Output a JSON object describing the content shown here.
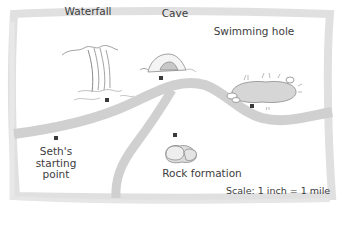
{
  "map": {
    "colors": {
      "background": "#ffffff",
      "border": "#dcdcdc",
      "road": "#cfcfcf",
      "marker": "#3a3a3a",
      "text": "#3d3d3d",
      "icon_stroke": "#8a8a8a",
      "water_fill": "#d6d6d6"
    },
    "landmarks": [
      {
        "id": "waterfall",
        "label": "Waterfall",
        "icon": "waterfall-icon",
        "label_x": 88,
        "label_y": 6,
        "marker_x": 107,
        "marker_y": 100
      },
      {
        "id": "cave",
        "label": "Cave",
        "icon": "cave-icon",
        "label_x": 175,
        "label_y": 8,
        "marker_x": 161,
        "marker_y": 77
      },
      {
        "id": "swimming-hole",
        "label": "Swimming hole",
        "icon": "pond-icon",
        "label_x": 255,
        "label_y": 27,
        "marker_x": 251,
        "marker_y": 105
      },
      {
        "id": "seths-starting-point",
        "label": "Seth's starting point",
        "label_lines": [
          "Seth's",
          "starting",
          "point"
        ],
        "icon": "",
        "label_x": 56,
        "label_y": 146,
        "marker_x": 55,
        "marker_y": 137
      },
      {
        "id": "rock-formation",
        "label": "Rock formation",
        "icon": "rock-icon",
        "label_x": 202,
        "label_y": 168,
        "marker_x": 174,
        "marker_y": 134
      }
    ],
    "scale_text": "Scale: 1 inch = 1 mile"
  }
}
